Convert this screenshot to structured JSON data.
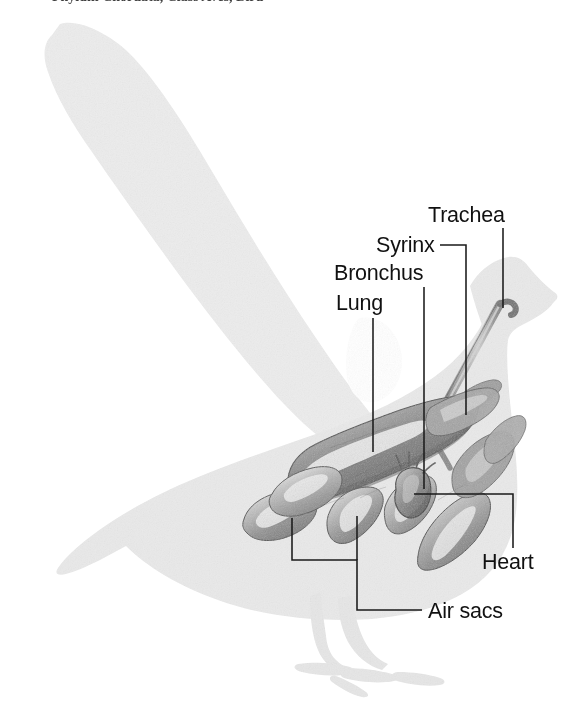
{
  "figure": {
    "subject": "bird",
    "style": "grayscale pencil illustration over light gray silhouette",
    "background_color": "#ffffff",
    "silhouette_color": "#ececec",
    "silhouette_body_color": "#e4e4e4",
    "organ_color": "#8d8d8d",
    "line_color": "#1a1a1a",
    "label_color": "#111111"
  },
  "caption": {
    "visible_fragment": "Phylum Chordata, Class Aves, Bird",
    "note": "top caption line is cropped at the image edge; only the bottom pixels of the letters are visible"
  },
  "labels": [
    {
      "id": "trachea",
      "text": "Trachea",
      "x": 428,
      "y": 222,
      "anchor": "start",
      "leader": "M 503 228 L 503 308"
    },
    {
      "id": "syrinx",
      "text": "Syrinx",
      "x": 376,
      "y": 252,
      "anchor": "start",
      "leader": "M 440 245 L 466 245 L 466 415"
    },
    {
      "id": "bronchus",
      "text": "Bronchus",
      "x": 334,
      "y": 280,
      "anchor": "start",
      "leader": "M 424 287 L 424 489"
    },
    {
      "id": "lung",
      "text": "Lung",
      "x": 336,
      "y": 310,
      "anchor": "start",
      "leader": "M 373 318 L 373 452"
    },
    {
      "id": "heart",
      "text": "Heart",
      "x": 482,
      "y": 569,
      "anchor": "start",
      "leader": "M 414 494 L 513 494 L 513 548"
    },
    {
      "id": "air-sacs",
      "text": "Air sacs",
      "x": 428,
      "y": 618,
      "anchor": "start",
      "leader": "M 292 518 L 292 560 L 357 560 L 357 610 L 422 610 M 357 560 L 357 516"
    }
  ],
  "organs": [
    {
      "id": "trachea",
      "name": "Trachea",
      "description": "long curved windpipe rising to the head"
    },
    {
      "id": "syrinx",
      "name": "Syrinx",
      "description": "vocal organ at the base of the trachea"
    },
    {
      "id": "bronchus",
      "name": "Bronchus",
      "description": "airway branching from the syrinx into the lung"
    },
    {
      "id": "lung",
      "name": "Lung",
      "description": "large elongated paired lung in the thorax"
    },
    {
      "id": "heart",
      "name": "Heart",
      "description": "small rounded heart beneath the lung"
    },
    {
      "id": "air-sacs",
      "name": "Air sacs",
      "description": "cluster of balloon-like sacs around the lung"
    }
  ]
}
